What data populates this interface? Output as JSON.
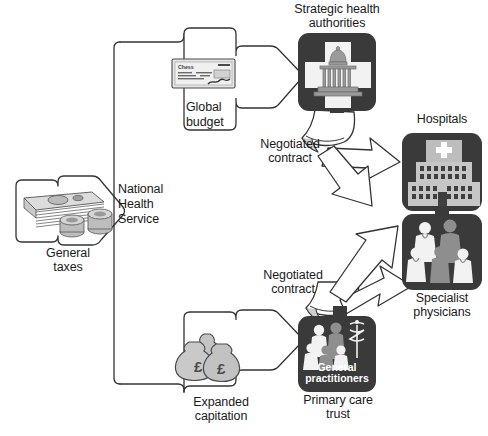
{
  "diagram": {
    "colors": {
      "node_fill": "#3a3a3a",
      "outline": "#333333",
      "background": "#ffffff",
      "money_fill": "#b8b8b8",
      "icon_white": "#f2f2f2",
      "icon_grey": "#9a9a9a"
    },
    "nodes": [
      {
        "id": "general-taxes",
        "label": "General taxes",
        "icon": "banknotes-and-coins-icon"
      },
      {
        "id": "nhs",
        "label": "National\nHealth\nService",
        "icon": "bracket-icon"
      },
      {
        "id": "global-budget",
        "label": "Global\nbudget",
        "icon": "cheque-icon"
      },
      {
        "id": "expanded-capitation",
        "label": "Expanded\ncapitation",
        "icon": "money-bags-icon"
      },
      {
        "id": "strategic-health-authorities",
        "label": "Strategic health\nauthorities",
        "icon": "government-building-cross-icon"
      },
      {
        "id": "hospitals",
        "label": "Hospitals",
        "icon": "hospital-building-icon"
      },
      {
        "id": "specialist-physicians",
        "label": "Specialist\nphysicians",
        "icon": "doctors-group-icon"
      },
      {
        "id": "primary-care-trust",
        "label": "Primary care\ntrust",
        "icon": "general-practitioners-icon"
      }
    ],
    "labels": {
      "general_taxes": "General taxes",
      "general_taxes_l1": "General",
      "general_taxes_l2": "taxes",
      "nhs_l1": "National",
      "nhs_l2": "Health",
      "nhs_l3": "Service",
      "global_budget_l1": "Global",
      "global_budget_l2": "budget",
      "expanded_capitation_l1": "Expanded",
      "expanded_capitation_l2": "capitation",
      "sha_l1": "Strategic health",
      "sha_l2": "authorities",
      "hospitals": "Hospitals",
      "specialist_l1": "Specialist",
      "specialist_l2": "physicians",
      "pct_l1": "Primary care",
      "pct_l2": "trust",
      "gp_inner_l1": "General",
      "gp_inner_l2": "practitioners",
      "negotiated_contract_top_l1": "Negotiated",
      "negotiated_contract_top_l2": "contract",
      "negotiated_contract_bottom_l1": "Negotiated",
      "negotiated_contract_bottom_l2": "contract",
      "cheque_payee": "Chess",
      "pound_symbol_1": "£",
      "pound_symbol_2": "£"
    }
  }
}
